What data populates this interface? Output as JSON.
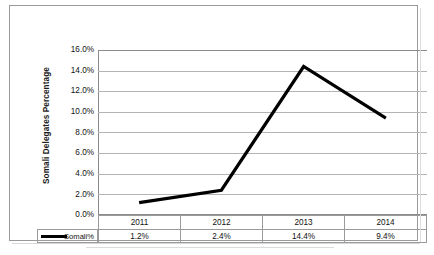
{
  "chart_data": {
    "type": "line",
    "title": "",
    "xlabel": "",
    "ylabel": "Somali Delegates Percentage",
    "categories": [
      "2011",
      "2012",
      "2013",
      "2014"
    ],
    "series": [
      {
        "name": "Somali%",
        "values": [
          1.2,
          2.4,
          14.4,
          9.4
        ],
        "labels": [
          "1.2%",
          "2.4%",
          "14.4%",
          "9.4%"
        ],
        "color": "#000000"
      }
    ],
    "ylim": [
      0,
      16
    ],
    "ytick_step": 2,
    "ytick_labels": [
      "16.0%",
      "14.0%",
      "12.0%",
      "10.0%",
      "8.0%",
      "6.0%",
      "4.0%",
      "2.0%",
      "0.0%"
    ],
    "grid": true,
    "legend_position": "data-table-left",
    "data_table": {
      "legend_label": "Somali%",
      "header": [
        "2011",
        "2012",
        "2013",
        "2014"
      ],
      "rows": [
        {
          "label": "Somali%",
          "cells": [
            "1.2%",
            "2.4%",
            "14.4%",
            "9.4%"
          ]
        }
      ]
    },
    "colors": {
      "line": "#000000",
      "gridline": "#b4b4b4",
      "axis": "#8c8c8c",
      "frame": "#9a9a9a",
      "background": "#ffffff",
      "text": "#111111"
    }
  }
}
